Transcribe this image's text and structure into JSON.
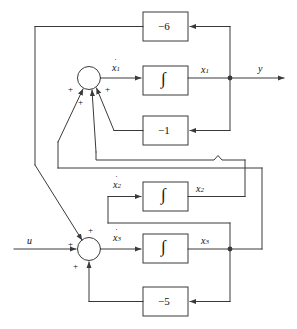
{
  "figure": {
    "kind": "control-block-diagram",
    "background_color": "#ffffff",
    "line_color": "#3a3a3a"
  },
  "signals": {
    "input_u": "u",
    "output_y": "y",
    "x1": "x",
    "x1_sub": "1",
    "x2": "x",
    "x2_sub": "2",
    "x3": "x",
    "x3_sub": "3",
    "x1dot": "x",
    "x1dot_sub": "1",
    "x2dot": "x",
    "x2dot_sub": "2",
    "x3dot": "x",
    "x3dot_sub": "3"
  },
  "blocks": [
    {
      "id": "gain-neg6",
      "label": "−6",
      "type": "gain",
      "value": -6
    },
    {
      "id": "integrator-x1",
      "label": "∫",
      "type": "integrator"
    },
    {
      "id": "gain-neg1",
      "label": "−1",
      "type": "gain",
      "value": -1
    },
    {
      "id": "integrator-x2",
      "label": "∫",
      "type": "integrator"
    },
    {
      "id": "integrator-x3",
      "label": "∫",
      "type": "integrator"
    },
    {
      "id": "gain-neg5",
      "label": "−5",
      "type": "gain",
      "value": -5
    }
  ],
  "summing_junctions": [
    {
      "id": "sum-top",
      "output": "x1dot",
      "signs": [
        "+",
        "+",
        "+",
        "+"
      ]
    },
    {
      "id": "sum-bottom",
      "output": "x3dot",
      "signs": [
        "+",
        "+",
        "+"
      ]
    }
  ],
  "sign_labels": {
    "plus": "+"
  }
}
